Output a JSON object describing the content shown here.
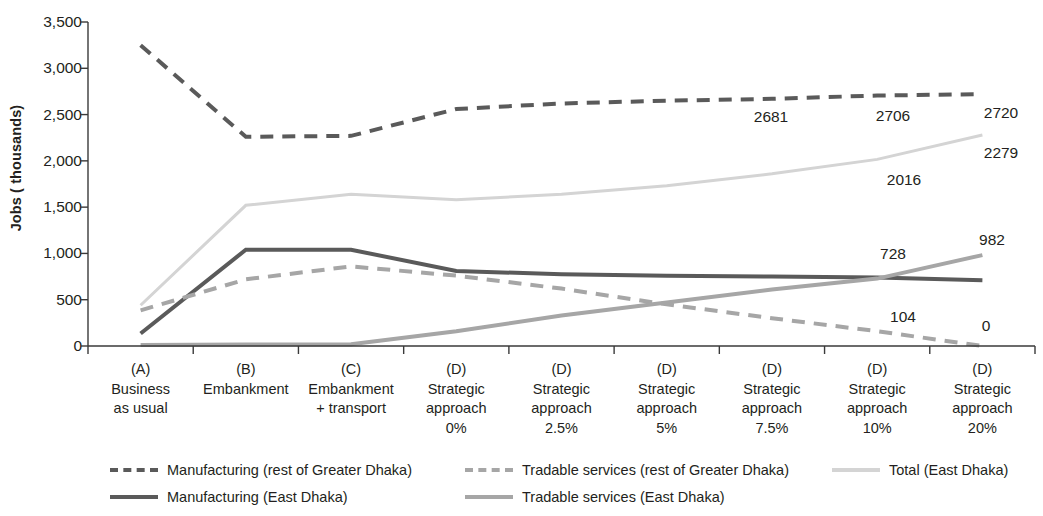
{
  "chart_data": {
    "type": "line",
    "title": "",
    "xlabel": "",
    "ylabel": "Jobs ( thousands)",
    "ylim": [
      0,
      3500
    ],
    "ytick_values": [
      0,
      500,
      1000,
      1500,
      2000,
      2500,
      3000,
      3500
    ],
    "ytick_labels": [
      "0",
      "500",
      "1,000",
      "1,500",
      "2,000",
      "2,500",
      "3,000",
      "3,500"
    ],
    "grid": false,
    "legend_position": "bottom",
    "categories": [
      "(A)\nBusiness\nas usual",
      "(B)\nEmbankment",
      "(C)\nEmbankment\n+ transport",
      "(D)\nStrategic\napproach\n0%",
      "(D)\nStrategic\napproach\n2.5%",
      "(D)\nStrategic\napproach\n5%",
      "(D)\nStrategic\napproach\n7.5%",
      "(D)\nStrategic\napproach\n10%",
      "(D)\nStrategic\napproach\n20%"
    ],
    "category_lines": [
      [
        "(A)",
        "Business",
        "as usual"
      ],
      [
        "(B)",
        "Embankment"
      ],
      [
        "(C)",
        "Embankment",
        "+ transport"
      ],
      [
        "(D)",
        "Strategic",
        "approach",
        "0%"
      ],
      [
        "(D)",
        "Strategic",
        "approach",
        "2.5%"
      ],
      [
        "(D)",
        "Strategic",
        "approach",
        "5%"
      ],
      [
        "(D)",
        "Strategic",
        "approach",
        "7.5%"
      ],
      [
        "(D)",
        "Strategic",
        "approach",
        "10%"
      ],
      [
        "(D)",
        "Strategic",
        "approach",
        "20%"
      ]
    ],
    "series": [
      {
        "name": "Manufacturing (rest of Greater Dhaka)",
        "style": "dashed",
        "color": "#5a5a5a",
        "width": 4,
        "values": [
          3250,
          2260,
          2270,
          2560,
          2620,
          2650,
          2670,
          2706,
          2720
        ]
      },
      {
        "name": "Manufacturing (East Dhaka)",
        "style": "solid",
        "color": "#5a5a5a",
        "width": 4,
        "values": [
          135,
          1040,
          1040,
          810,
          775,
          760,
          750,
          740,
          710
        ]
      },
      {
        "name": "Tradable services (rest of Greater Dhaka)",
        "style": "dashed",
        "color": "#a6a6a6",
        "width": 4,
        "values": [
          385,
          720,
          860,
          760,
          620,
          450,
          300,
          160,
          0
        ]
      },
      {
        "name": "Tradable services (East Dhaka)",
        "style": "solid",
        "color": "#a6a6a6",
        "width": 4,
        "values": [
          10,
          15,
          20,
          160,
          330,
          470,
          610,
          728,
          982
        ]
      },
      {
        "name": "Total (East Dhaka)",
        "style": "solid",
        "color": "#d4d4d4",
        "width": 3,
        "values": [
          440,
          1520,
          1640,
          1580,
          1640,
          1730,
          1860,
          2016,
          2279
        ]
      }
    ],
    "annotations": [
      {
        "text": "2681",
        "x": 771,
        "y": 117
      },
      {
        "text": "2706",
        "x": 893,
        "y": 116
      },
      {
        "text": "2720",
        "x": 1001,
        "y": 113
      },
      {
        "text": "2279",
        "x": 1001,
        "y": 153
      },
      {
        "text": "2016",
        "x": 904,
        "y": 180
      },
      {
        "text": "728",
        "x": 893,
        "y": 254
      },
      {
        "text": "982",
        "x": 992,
        "y": 240
      },
      {
        "text": "104",
        "x": 903,
        "y": 317
      },
      {
        "text": "0",
        "x": 986,
        "y": 326
      }
    ]
  },
  "legend": {
    "items": [
      {
        "label": "Manufacturing (rest of Greater Dhaka)",
        "color": "#5a5a5a",
        "style": "dashed",
        "x": 110,
        "y": 0
      },
      {
        "label": "Manufacturing (East Dhaka)",
        "color": "#5a5a5a",
        "style": "solid",
        "x": 110,
        "y": 27
      },
      {
        "label": "Tradable services (rest of Greater Dhaka)",
        "color": "#a6a6a6",
        "style": "dashed",
        "x": 465,
        "y": 0
      },
      {
        "label": "Tradable services (East Dhaka)",
        "color": "#a6a6a6",
        "style": "solid",
        "x": 465,
        "y": 27
      },
      {
        "label": "Total (East Dhaka)",
        "color": "#d4d4d4",
        "style": "solid",
        "x": 832,
        "y": 0
      }
    ]
  },
  "geometry": {
    "plot_left": 88,
    "plot_right": 1035,
    "plot_top": 22,
    "plot_bottom": 346
  }
}
